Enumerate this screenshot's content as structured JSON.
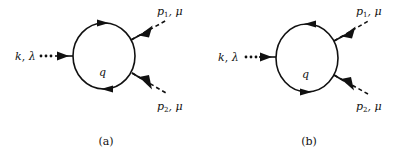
{
  "figure": {
    "panels": [
      {
        "id": "a",
        "caption": "(a)",
        "incoming_label": "k, λ",
        "incoming_momentum": "k",
        "incoming_index": "λ",
        "loop_label": "q",
        "loop_orientation": "counter-clockwise",
        "external_1": {
          "momentum": "p",
          "subscript": "1",
          "index": ", μ"
        },
        "external_2": {
          "momentum": "p",
          "subscript": "2",
          "index": ", μ"
        }
      },
      {
        "id": "b",
        "caption": "(b)",
        "incoming_label": "k, λ",
        "incoming_momentum": "k",
        "incoming_index": "λ",
        "loop_label": "q",
        "loop_orientation": "clockwise",
        "external_1": {
          "momentum": "p",
          "subscript": "1",
          "index": ", μ"
        },
        "external_2": {
          "momentum": "p",
          "subscript": "2",
          "index": ", μ"
        }
      }
    ],
    "line_styles": {
      "incoming": "dotted",
      "loop": "solid",
      "external": "dashed"
    },
    "colors": {
      "ink": "#111111",
      "background": "#ffffff"
    }
  }
}
